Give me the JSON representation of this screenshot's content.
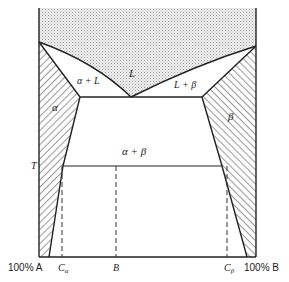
{
  "diagram": {
    "type": "binary eutectic phase diagram",
    "regions": {
      "liquid": "L",
      "alpha_liquid": "α + L",
      "beta_liquid": "L + β",
      "alpha": "α",
      "beta": "β",
      "alpha_beta": "α + β"
    },
    "axis": {
      "left": "100% A",
      "right": "100% B",
      "c_alpha": "C",
      "c_alpha_sub": "α",
      "b": "B",
      "c_beta": "C",
      "c_beta_sub": "β",
      "temperature": "T"
    },
    "colors": {
      "line": "#222222",
      "liquid_fill": "#e6e6e6"
    }
  }
}
